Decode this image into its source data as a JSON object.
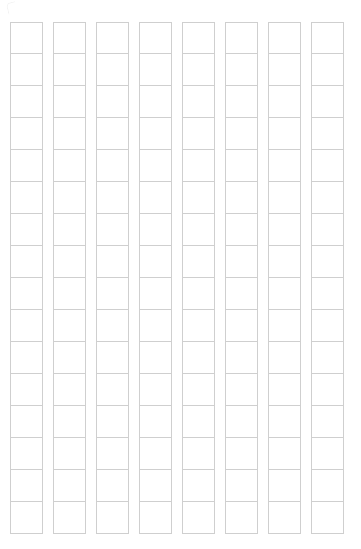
{
  "document": {
    "kind": "blank-grid-worksheet",
    "title": "",
    "background_color": "#ffffff",
    "page_width": 361,
    "page_height": 549
  },
  "grid": {
    "columns": 8,
    "rows": 16,
    "total_cells": 128,
    "cell_width": 33,
    "cell_height": 32,
    "column_gap": 10,
    "origin_x": 10,
    "origin_y": 22,
    "line_color": "#cfcfcf",
    "cell_fill": "#ffffff",
    "cell_text": "",
    "column_labels": [
      "",
      "",
      "",
      "",
      "",
      "",
      "",
      ""
    ],
    "row_labels": [
      "",
      "",
      "",
      "",
      "",
      "",
      "",
      "",
      "",
      "",
      "",
      "",
      "",
      "",
      "",
      ""
    ]
  },
  "marks": {
    "corner_mark_label": ""
  }
}
